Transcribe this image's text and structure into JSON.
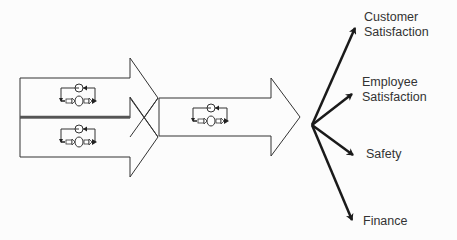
{
  "diagram": {
    "inputs": [
      {
        "id": "loop-a",
        "icon": "control-loop-icon"
      },
      {
        "id": "loop-b",
        "icon": "control-loop-icon"
      }
    ],
    "combined": {
      "id": "loop-combined",
      "icon": "control-loop-icon"
    },
    "outcomes": [
      {
        "line1": "Customer",
        "line2": "Satisfaction"
      },
      {
        "line1": "Employee",
        "line2": "Satisfaction"
      },
      {
        "line1": "Safety",
        "line2": ""
      },
      {
        "line1": "Finance",
        "line2": ""
      }
    ],
    "colors": {
      "stroke": "#333333",
      "arrow": "#1a1a1a",
      "background": "#fcfcfc",
      "text": "#333333"
    }
  }
}
